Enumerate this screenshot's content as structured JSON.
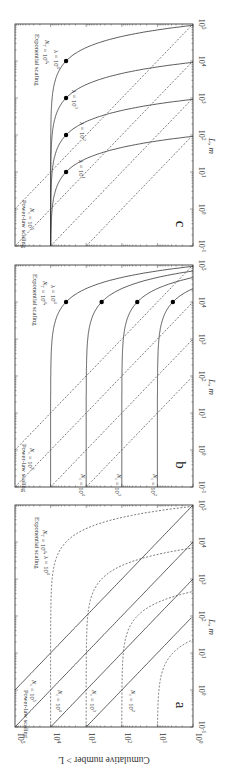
{
  "figure": {
    "orientation": "rotated-90-clockwise",
    "y_axis_label": "Cumulative number > L",
    "x_axis_label": "L, m",
    "x_tick_labels": [
      "10^-1",
      "10^0",
      "10^1",
      "10^2",
      "10^3",
      "10^4",
      "10^5"
    ],
    "y_tick_labels": [
      "10^0",
      "10^1",
      "10^2",
      "10^3",
      "10^4",
      "10^5"
    ]
  },
  "chart_data": [
    {
      "panel": "a",
      "type": "line",
      "title": "",
      "xlabel": "L, m",
      "ylabel": "Cumulative number > L",
      "xscale": "log",
      "yscale": "log",
      "xlim": [
        0.1,
        100000
      ],
      "ylim": [
        1,
        100000
      ],
      "annotations": [
        "Power-law scaling",
        "N_c = 10^5",
        "N_c = 10^4",
        "N_c = 10^3",
        "N_c = 10^2",
        "Exponential scaling",
        "N_T = 10^4, λ = 10^4"
      ],
      "series": [
        {
          "name": "Power-law N_c=10^5",
          "style": "solid",
          "kind": "powerlaw",
          "Nc": 100000
        },
        {
          "name": "Power-law N_c=10^4",
          "style": "solid",
          "kind": "powerlaw",
          "Nc": 10000
        },
        {
          "name": "Power-law N_c=10^3",
          "style": "solid",
          "kind": "powerlaw",
          "Nc": 1000
        },
        {
          "name": "Power-law N_c=10^2",
          "style": "solid",
          "kind": "powerlaw",
          "Nc": 100
        },
        {
          "name": "Exponential N_T=10^4, λ=10^4",
          "style": "dashed",
          "kind": "exp",
          "NT": 10000,
          "lambda": 10000
        },
        {
          "name": "Exponential N_T=10^3, λ=10^3",
          "style": "dashed",
          "kind": "exp",
          "NT": 1000,
          "lambda": 1000
        },
        {
          "name": "Exponential N_T=10^2, λ=10^2",
          "style": "dashed",
          "kind": "exp",
          "NT": 100,
          "lambda": 100
        },
        {
          "name": "Exponential N_T=10^1, λ=10^1",
          "style": "dashed",
          "kind": "exp",
          "NT": 10,
          "lambda": 10
        }
      ]
    },
    {
      "panel": "b",
      "type": "line",
      "title": "",
      "xlabel": "L, m",
      "ylabel": "Cumulative number > L",
      "xscale": "log",
      "yscale": "log",
      "xlim": [
        0.1,
        100000
      ],
      "ylim": [
        1,
        100000
      ],
      "annotations": [
        "Power-law scaling",
        "N_c = 10^5",
        "N_c = 10^4",
        "N_c = 10^3",
        "N_c = 10^2",
        "Exponential scaling",
        "N_T = 10^4,",
        "λ = 10^4"
      ],
      "series": [
        {
          "name": "Exponential N_T=10^4, λ=10^4",
          "style": "solid",
          "kind": "exp",
          "NT": 10000,
          "lambda": 10000,
          "marker_L": 10000
        },
        {
          "name": "Exponential N_T=10^3, λ=10^4",
          "style": "solid",
          "kind": "exp",
          "NT": 1000,
          "lambda": 10000,
          "marker_L": 10000
        },
        {
          "name": "Exponential N_T=10^2, λ=10^4",
          "style": "solid",
          "kind": "exp",
          "NT": 100,
          "lambda": 10000,
          "marker_L": 10000
        },
        {
          "name": "Exponential N_T=10^1, λ=10^4",
          "style": "solid",
          "kind": "exp",
          "NT": 10,
          "lambda": 10000,
          "marker_L": 10000
        },
        {
          "name": "Power-law N_c=10^5",
          "style": "dashed",
          "kind": "powerlaw",
          "Nc": 100000
        },
        {
          "name": "Power-law N_c=10^4",
          "style": "dashed",
          "kind": "powerlaw",
          "Nc": 10000
        },
        {
          "name": "Power-law N_c=10^3",
          "style": "dashed",
          "kind": "powerlaw",
          "Nc": 1000
        },
        {
          "name": "Power-law N_c=10^2",
          "style": "dashed",
          "kind": "powerlaw",
          "Nc": 100
        }
      ]
    },
    {
      "panel": "c",
      "type": "line",
      "title": "",
      "xlabel": "L, m",
      "ylabel": "Cumulative number > L",
      "xscale": "log",
      "yscale": "log",
      "xlim": [
        0.1,
        100000
      ],
      "ylim": [
        1,
        100000
      ],
      "annotations": [
        "Power-law scaling",
        "N_c = 10^5",
        "Exponential scaling",
        "N_T = 10^4,",
        "λ = 10^4",
        "λ = 10^3",
        "λ = 10^2",
        "λ = 10^1"
      ],
      "series": [
        {
          "name": "Exponential N_T=10^4, λ=10^4",
          "style": "solid",
          "kind": "exp",
          "NT": 10000,
          "lambda": 10000,
          "marker_L": 10000
        },
        {
          "name": "Exponential N_T=10^4, λ=10^3",
          "style": "solid",
          "kind": "exp",
          "NT": 10000,
          "lambda": 1000,
          "marker_L": 1000
        },
        {
          "name": "Exponential N_T=10^4, λ=10^2",
          "style": "solid",
          "kind": "exp",
          "NT": 10000,
          "lambda": 100,
          "marker_L": 100
        },
        {
          "name": "Exponential N_T=10^4, λ=10^1",
          "style": "solid",
          "kind": "exp",
          "NT": 10000,
          "lambda": 10,
          "marker_L": 10
        },
        {
          "name": "Power-law N_c=10^5",
          "style": "dashed",
          "kind": "powerlaw",
          "Nc": 100000
        },
        {
          "name": "Power-law N_c=10^4",
          "style": "dashed",
          "kind": "powerlaw",
          "Nc": 10000
        },
        {
          "name": "Power-law N_c=10^3",
          "style": "dashed",
          "kind": "powerlaw",
          "Nc": 1000
        },
        {
          "name": "Power-law N_c=10^2",
          "style": "dashed",
          "kind": "powerlaw",
          "Nc": 100
        }
      ]
    }
  ],
  "panels": {
    "a": {
      "letter": "a",
      "labels": {
        "powerlaw": "Power-law scaling",
        "nc5": "N_c = 10^5",
        "nc4": "N_c = 10^4",
        "nc3": "N_c = 10^3",
        "nc2": "N_c = 10^2",
        "exp": "Exponential scaling",
        "exp_params": "N_T = 10^4, λ = 10^4"
      }
    },
    "b": {
      "letter": "b",
      "labels": {
        "powerlaw": "Power-law scaling",
        "nc5": "N_c = 10^5",
        "nc4": "N_c = 10^4",
        "nc3": "N_c = 10^3",
        "nc2": "N_c = 10^2",
        "exp": "Exponential scaling",
        "exp_nt": "N_T = 10^4,",
        "exp_lambda": "λ = 10^4"
      }
    },
    "c": {
      "letter": "c",
      "labels": {
        "powerlaw": "Power-law scaling",
        "nc5": "N_c = 10^5",
        "exp": "Exponential scaling",
        "exp_nt": "N_T = 10^4,",
        "l4": "λ = 10^4",
        "l3": "λ = 10^3",
        "l2": "λ = 10^2",
        "l1": "λ = 10^1"
      }
    }
  }
}
